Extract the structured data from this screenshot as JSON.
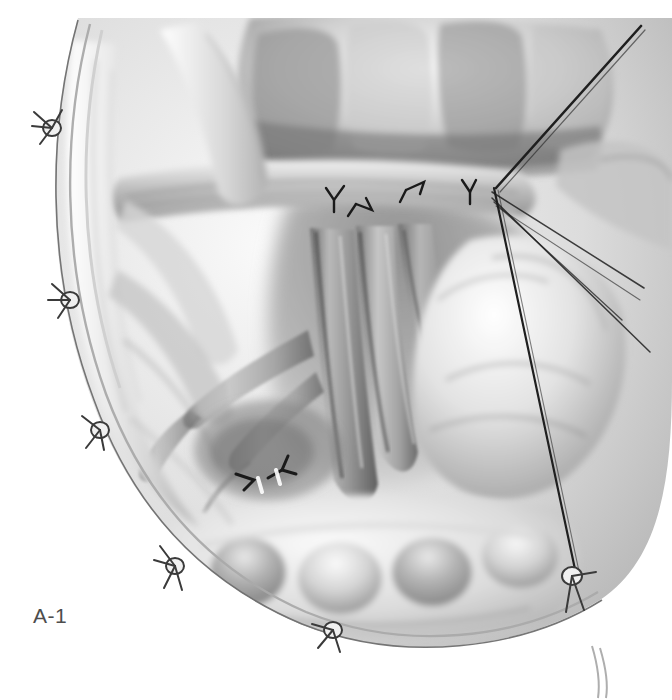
{
  "figure": {
    "label": "A-1",
    "label_color": "#4d4d4d",
    "medium": "grayscale-medical-illustration",
    "background_color": "#ffffff",
    "canvas": {
      "width": 672,
      "height": 700
    }
  },
  "palette": {
    "paper": "#ffffff",
    "highlight": "#f7f7f7",
    "light_gray": "#dcdcdc",
    "mid_gray": "#b0b0b0",
    "tone_gray": "#8f8f8f",
    "deep_gray": "#6a6a6a",
    "shadow": "#4a4a4a",
    "ink": "#2b2b2b",
    "suture_ink": "#1f1f1f"
  },
  "regions": [
    {
      "name": "incision-edge-left",
      "note": "wound margin arcs from top-left down to bottom-center"
    },
    {
      "name": "incision-edge-bottom",
      "note": "wound margin sweeps right along lower border"
    },
    {
      "name": "bowel-loops-superior",
      "note": "transverse haustrated bowel across the upper field"
    },
    {
      "name": "bowel-loops-inferior",
      "note": "haustrated bowel across the lower field"
    },
    {
      "name": "mesenteric-vessel-bundle",
      "note": "central vertical vascular trunks descending through the window"
    },
    {
      "name": "vessel-branch-left",
      "note": "branching vessel arcade toward the left lower quadrant"
    },
    {
      "name": "organ-mass-right",
      "note": "pale rounded organ surface on the right of the field"
    },
    {
      "name": "peritoneal-fold-superior",
      "note": "transverse tissue fold spanning the upper midfield"
    }
  ],
  "stay_sutures": [
    {
      "id": "suture-left-1",
      "x": 52,
      "y": 128
    },
    {
      "id": "suture-left-2",
      "x": 70,
      "y": 300
    },
    {
      "id": "suture-left-3",
      "x": 100,
      "y": 430
    },
    {
      "id": "suture-left-4",
      "x": 175,
      "y": 566
    },
    {
      "id": "suture-bottom-1",
      "x": 333,
      "y": 630
    },
    {
      "id": "suture-bottom-right-1",
      "x": 572,
      "y": 575
    }
  ],
  "vessel_ties": [
    {
      "id": "tie-upper-left",
      "x": 334,
      "y": 196
    },
    {
      "id": "tie-upper-mid",
      "x": 370,
      "y": 210
    },
    {
      "id": "tie-upper-right",
      "x": 418,
      "y": 186
    },
    {
      "id": "tie-upper-far-right",
      "x": 468,
      "y": 192
    },
    {
      "id": "tie-lower-left",
      "x": 250,
      "y": 480
    },
    {
      "id": "tie-lower-right",
      "x": 282,
      "y": 466
    }
  ],
  "suture_threads": [
    {
      "id": "thread-main-diagonal",
      "from": [
        641,
        28
      ],
      "to": [
        496,
        190
      ],
      "note": "long traction thread entering from top-right"
    },
    {
      "id": "thread-long-right",
      "from": [
        494,
        188
      ],
      "to": [
        578,
        576
      ],
      "note": "taut thread running to lower-right stay suture"
    },
    {
      "id": "thread-fan-1",
      "from": [
        492,
        192
      ],
      "to": [
        643,
        288
      ]
    },
    {
      "id": "thread-fan-2",
      "from": [
        492,
        196
      ],
      "to": [
        648,
        352
      ]
    },
    {
      "id": "thread-fan-3",
      "from": [
        494,
        200
      ],
      "to": [
        620,
        318
      ]
    }
  ]
}
